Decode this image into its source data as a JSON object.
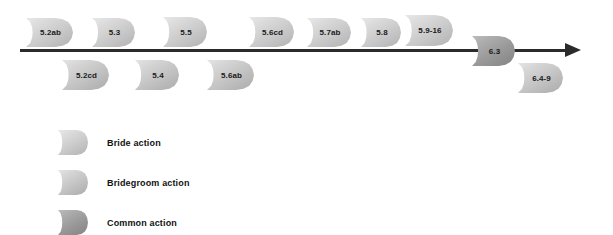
{
  "diagram": {
    "type": "timeline",
    "title": "",
    "background_color": "#ffffff",
    "axis": {
      "name": "timeline-arrow",
      "direction": "left-to-right",
      "color": "#2b2b2b",
      "has_arrowhead": true
    }
  },
  "nodes": {
    "above_axis": [
      {
        "label": "5.2ab",
        "category": "bride"
      },
      {
        "label": "5.3",
        "category": "bride"
      },
      {
        "label": "5.5",
        "category": "bride"
      },
      {
        "label": "5.6cd",
        "category": "bride"
      },
      {
        "label": "5.7ab",
        "category": "bride"
      },
      {
        "label": "5.8",
        "category": "bride"
      },
      {
        "label": "5.9-16",
        "category": "bride"
      }
    ],
    "below_axis": [
      {
        "label": "5.2cd",
        "category": "bridegroom"
      },
      {
        "label": "5.4",
        "category": "bridegroom"
      },
      {
        "label": "5.6ab",
        "category": "bridegroom"
      },
      {
        "label": "6.4-9",
        "category": "bridegroom"
      }
    ],
    "on_axis": [
      {
        "label": "6.3",
        "category": "common"
      }
    ]
  },
  "legend": {
    "items": [
      {
        "label": "Bride action",
        "category": "bride",
        "color": "#cbcbcb"
      },
      {
        "label": "Bridegroom action",
        "category": "bridegroom",
        "color": "#c4c4c4"
      },
      {
        "label": "Common action",
        "category": "common",
        "color": "#9b9b9b"
      }
    ]
  }
}
